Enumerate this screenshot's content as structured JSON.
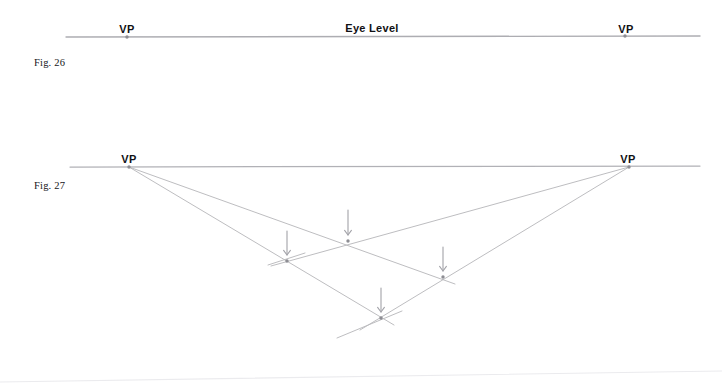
{
  "page": {
    "background": "#ffffff",
    "width": 722,
    "height": 391,
    "ink_color": "#b9b9bd",
    "horizon_color": "#a9a9ae",
    "dot_color": "#8d8d93",
    "arrow_color": "#a2a2a8",
    "text_color": "#111114"
  },
  "figures": [
    {
      "id": "fig-26",
      "caption": "Fig. 26",
      "caption_pos": {
        "x": 34,
        "y": 57
      },
      "horizon": {
        "x1": 66,
        "y1": 37,
        "x2": 700,
        "y2": 36
      },
      "eye_level_label": "Eye Level",
      "eye_level_label_pos": {
        "x": 372,
        "y": 22
      },
      "vanishing_points": [
        {
          "label": "VP",
          "x": 127,
          "y": 37,
          "label_x": 127,
          "label_y": 23
        },
        {
          "label": "VP",
          "x": 625,
          "y": 36,
          "label_x": 626,
          "label_y": 23
        }
      ]
    },
    {
      "id": "fig-27",
      "caption": "Fig. 27",
      "caption_pos": {
        "x": 34,
        "y": 180
      },
      "horizon": {
        "x1": 70,
        "y1": 167,
        "x2": 700,
        "y2": 166
      },
      "vanishing_points": [
        {
          "label": "VP",
          "x": 129,
          "y": 167,
          "label_x": 129,
          "label_y": 153
        },
        {
          "label": "VP",
          "x": 629,
          "y": 167,
          "label_x": 628,
          "label_y": 153
        }
      ],
      "construction_lines": [
        {
          "name": "left-vp-to-lower-right",
          "x1": 129,
          "y1": 167,
          "x2": 455,
          "y2": 284
        },
        {
          "name": "left-vp-to-bottom",
          "x1": 129,
          "y1": 167,
          "x2": 394,
          "y2": 325
        },
        {
          "name": "right-vp-to-upper-left",
          "x1": 629,
          "y1": 167,
          "x2": 271,
          "y2": 266
        },
        {
          "name": "right-vp-to-bottom-left",
          "x1": 629,
          "y1": 167,
          "x2": 360,
          "y2": 330
        }
      ],
      "cross_strokes": [
        {
          "name": "upper-left-tick",
          "x1": 268,
          "y1": 265,
          "x2": 305,
          "y2": 253
        },
        {
          "name": "bottom-tick",
          "x1": 337,
          "y1": 338,
          "x2": 402,
          "y2": 311
        }
      ],
      "intersections": [
        {
          "name": "intersection-center-upper",
          "x": 348,
          "y": 241
        },
        {
          "name": "intersection-left",
          "x": 287,
          "y": 261
        },
        {
          "name": "intersection-right",
          "x": 443,
          "y": 277
        },
        {
          "name": "intersection-bottom",
          "x": 381,
          "y": 318
        }
      ],
      "arrows": [
        {
          "name": "arrow-center-upper",
          "x": 348,
          "y_top": 210,
          "y_tip": 235
        },
        {
          "name": "arrow-left",
          "x": 287,
          "y_top": 231,
          "y_tip": 255
        },
        {
          "name": "arrow-right",
          "x": 443,
          "y_top": 247,
          "y_tip": 271
        },
        {
          "name": "arrow-bottom",
          "x": 381,
          "y_top": 288,
          "y_tip": 312
        }
      ]
    }
  ],
  "scan_artifacts": [
    {
      "name": "page-edge-line",
      "x1": 0,
      "y1": 382,
      "x2": 722,
      "y2": 371
    }
  ]
}
